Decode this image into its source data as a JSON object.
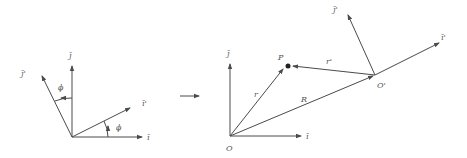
{
  "diagram": {
    "type": "coordinate-frame-transformation",
    "colors": {
      "line": "#4a4a4a",
      "label": "#555555",
      "background": "#ffffff"
    },
    "left_panel": {
      "axes": [
        {
          "id": "i",
          "label": "ī"
        },
        {
          "id": "j",
          "label": "j̄"
        },
        {
          "id": "i_prime",
          "label": "ī'"
        },
        {
          "id": "j_prime",
          "label": "j̄'"
        }
      ],
      "angles": [
        {
          "id": "phi_i",
          "label": "ϕ"
        },
        {
          "id": "phi_j",
          "label": "ϕ"
        }
      ]
    },
    "transition_arrow": {
      "symbol": "→"
    },
    "right_panel": {
      "origin_label": "O",
      "moving_origin_label": "O'",
      "point_label": "P",
      "axes": [
        {
          "id": "i",
          "label": "ī"
        },
        {
          "id": "j",
          "label": "j̄"
        },
        {
          "id": "i_prime",
          "label": "ī'"
        },
        {
          "id": "j_prime",
          "label": "j̄'"
        }
      ],
      "vectors": [
        {
          "id": "r",
          "label": "r"
        },
        {
          "id": "r_prime",
          "label": "r'"
        },
        {
          "id": "R",
          "label": "R"
        }
      ]
    }
  }
}
